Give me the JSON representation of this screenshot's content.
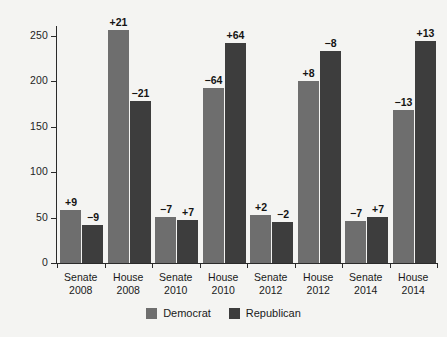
{
  "chart_data": {
    "type": "bar",
    "title": "",
    "subtitle": "",
    "xlabel": "",
    "ylabel": "",
    "ylim": [
      0,
      265
    ],
    "yticks": [
      0,
      50,
      100,
      150,
      200,
      250
    ],
    "grid": false,
    "legend_position": "bottom-center",
    "categories": [
      "Senate 2008",
      "House 2008",
      "Senate 2010",
      "House 2010",
      "Senate 2012",
      "House 2012",
      "Senate 2014",
      "House 2014"
    ],
    "category_lines": [
      {
        "chamber": "Senate",
        "year": "2008"
      },
      {
        "chamber": "House",
        "year": "2008"
      },
      {
        "chamber": "Senate",
        "year": "2010"
      },
      {
        "chamber": "House",
        "year": "2010"
      },
      {
        "chamber": "Senate",
        "year": "2012"
      },
      {
        "chamber": "House",
        "year": "2012"
      },
      {
        "chamber": "Senate",
        "year": "2014"
      },
      {
        "chamber": "House",
        "year": "2014"
      }
    ],
    "series": [
      {
        "name": "Democrat",
        "color": "#6e6e6e",
        "values": [
          58,
          257,
          51,
          193,
          53,
          201,
          46,
          168
        ],
        "annotations": [
          "+9",
          "+21",
          "−7",
          "−64",
          "+2",
          "+8",
          "−7",
          "−13"
        ]
      },
      {
        "name": "Republican",
        "color": "#3d3d3d",
        "values": [
          42,
          178,
          47,
          242,
          45,
          234,
          51,
          245
        ],
        "annotations": [
          "−9",
          "−21",
          "+7",
          "+64",
          "−2",
          "−8",
          "+7",
          "+13"
        ]
      }
    ]
  },
  "legend": {
    "items": [
      {
        "label": "Democrat",
        "color": "#6e6e6e"
      },
      {
        "label": "Republican",
        "color": "#3d3d3d"
      }
    ]
  },
  "colors": {
    "background": "#f4f4f2",
    "axis": "#2a2a2a",
    "text": "#1a1a1a",
    "democrat": "#6e6e6e",
    "republican": "#3d3d3d"
  }
}
